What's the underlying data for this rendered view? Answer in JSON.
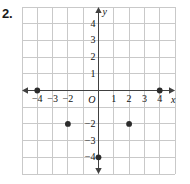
{
  "exercise": {
    "number": "2."
  },
  "chart_data": {
    "type": "scatter",
    "title": "",
    "xlabel": "x",
    "ylabel": "y",
    "grid": true,
    "legend": false,
    "xlim": [
      -5,
      5
    ],
    "ylim": [
      -5,
      5
    ],
    "x_ticks": [
      {
        "value": -4,
        "label": "−4"
      },
      {
        "value": -3,
        "label": "−3"
      },
      {
        "value": -2,
        "label": "−2"
      },
      {
        "value": 1,
        "label": "1"
      },
      {
        "value": 2,
        "label": "2"
      },
      {
        "value": 3,
        "label": "3"
      },
      {
        "value": 4,
        "label": "4"
      }
    ],
    "y_ticks": [
      {
        "value": 4,
        "label": "4"
      },
      {
        "value": 3,
        "label": "3"
      },
      {
        "value": 2,
        "label": "2"
      },
      {
        "value": 1,
        "label": "1"
      },
      {
        "value": -2,
        "label": "−2"
      },
      {
        "value": -3,
        "label": "−3"
      },
      {
        "value": -4,
        "label": "−4"
      }
    ],
    "origin_label": "O",
    "points": [
      {
        "x": -4,
        "y": 0
      },
      {
        "x": 4,
        "y": 0
      },
      {
        "x": -2,
        "y": -2
      },
      {
        "x": 2,
        "y": -2
      },
      {
        "x": 0,
        "y": -4
      }
    ],
    "colors": {
      "grid_line": "#c9c9c9",
      "axis_line": "#404040",
      "point_fill": "#2b2b2b",
      "label_text": "#111111",
      "background": "#ffffff"
    }
  }
}
